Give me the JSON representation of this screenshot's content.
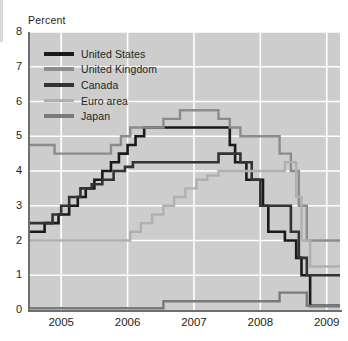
{
  "chart_data": {
    "type": "line",
    "title": "",
    "subtitle": "",
    "xlabel": "",
    "ylabel": "Percent",
    "ylim": [
      0,
      8
    ],
    "yticks": [
      0,
      1,
      2,
      3,
      4,
      5,
      6,
      7,
      8
    ],
    "xlim": [
      2004.5,
      2009.2
    ],
    "xticks": [
      2005,
      2006,
      2007,
      2008,
      2009
    ],
    "xtick_labels": [
      "2005",
      "2006",
      "2007",
      "2008",
      "2009"
    ],
    "grid": true,
    "grid_color": "#ffffff",
    "plot_background": "#cdcdcd",
    "legend_position": "upper left",
    "step": true,
    "series": [
      {
        "name": "United States",
        "color": "#1a1a1a",
        "width": 2.6,
        "x": [
          2004.5,
          2004.62,
          2004.75,
          2004.96,
          2005.12,
          2005.25,
          2005.37,
          2005.5,
          2005.62,
          2005.75,
          2005.87,
          2006.0,
          2006.12,
          2006.25,
          2006.46,
          2007.54,
          2007.62,
          2007.79,
          2008.04,
          2008.12,
          2008.21,
          2008.37,
          2008.54,
          2008.62,
          2008.75,
          2009.2
        ],
        "y": [
          2.25,
          2.25,
          2.5,
          2.75,
          3.0,
          3.25,
          3.5,
          3.75,
          4.0,
          4.25,
          4.5,
          4.75,
          5.0,
          5.25,
          5.25,
          4.75,
          4.25,
          3.75,
          3.0,
          2.25,
          2.25,
          2.0,
          1.5,
          1.0,
          0.12,
          0.12
        ]
      },
      {
        "name": "United Kingdom",
        "color": "#8c8c8c",
        "width": 2.4,
        "x": [
          2004.5,
          2004.9,
          2005.6,
          2005.75,
          2005.9,
          2006.04,
          2006.2,
          2006.37,
          2006.54,
          2006.79,
          2006.95,
          2007.2,
          2007.37,
          2007.54,
          2007.7,
          2008.04,
          2008.29,
          2008.46,
          2008.58,
          2008.7,
          2009.2
        ],
        "y": [
          4.75,
          4.5,
          4.5,
          4.75,
          5.0,
          5.25,
          5.25,
          5.25,
          5.5,
          5.75,
          5.75,
          5.75,
          5.5,
          5.25,
          5.0,
          5.0,
          4.5,
          4.0,
          3.0,
          2.0,
          2.0
        ]
      },
      {
        "name": "Canada",
        "color": "#333333",
        "width": 2.6,
        "x": [
          2004.5,
          2004.75,
          2004.87,
          2005.0,
          2005.12,
          2005.29,
          2005.46,
          2005.62,
          2005.79,
          2005.96,
          2006.08,
          2006.29,
          2007.37,
          2007.5,
          2007.7,
          2007.87,
          2008.0,
          2008.21,
          2008.46,
          2008.58,
          2008.7,
          2009.2
        ],
        "y": [
          2.5,
          2.5,
          2.75,
          3.0,
          3.25,
          3.5,
          3.62,
          3.75,
          4.0,
          4.12,
          4.25,
          4.25,
          4.5,
          4.5,
          4.25,
          3.75,
          3.0,
          3.0,
          2.25,
          1.5,
          1.0,
          1.0
        ]
      },
      {
        "name": "Euro area",
        "color": "#b0b0b0",
        "width": 2.4,
        "x": [
          2004.5,
          2005.87,
          2006.04,
          2006.2,
          2006.37,
          2006.54,
          2006.7,
          2006.87,
          2007.04,
          2007.2,
          2007.37,
          2007.54,
          2008.12,
          2008.37,
          2008.54,
          2008.62,
          2008.75,
          2009.2
        ],
        "y": [
          2.0,
          2.0,
          2.25,
          2.5,
          2.75,
          3.0,
          3.25,
          3.5,
          3.75,
          3.87,
          4.0,
          4.0,
          4.0,
          4.25,
          3.25,
          2.0,
          1.25,
          1.25
        ]
      },
      {
        "name": "Japan",
        "color": "#7a7a7a",
        "width": 2.4,
        "x": [
          2004.5,
          2006.0,
          2006.54,
          2008.29,
          2008.54,
          2008.7,
          2009.2
        ],
        "y": [
          0.05,
          0.05,
          0.25,
          0.5,
          0.5,
          0.12,
          0.12
        ]
      }
    ]
  },
  "legend": {
    "entries": [
      {
        "label": "United States"
      },
      {
        "label": "United Kingdom"
      },
      {
        "label": "Canada"
      },
      {
        "label": "Euro area"
      },
      {
        "label": "Japan"
      }
    ]
  }
}
